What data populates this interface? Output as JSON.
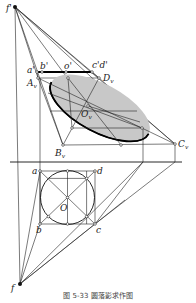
{
  "diagram": {
    "type": "shadow-construction",
    "labels": {
      "f_prime": "f'",
      "f": "f",
      "a_prime": "a'",
      "b_prime": "b'",
      "o_prime": "o'",
      "cd_prime": "c'd'",
      "A_v": "A",
      "B_v": "B",
      "C_v": "C",
      "D_v": "D",
      "O_v": "O",
      "v_sub": "v",
      "a": "a",
      "b": "b",
      "c": "c",
      "d": "d",
      "O": "O"
    },
    "colors": {
      "ellipse_fill": "#c8c8c8",
      "line": "#222222",
      "background": "#ffffff"
    }
  },
  "caption": "图 5-33  圆落影求作图"
}
